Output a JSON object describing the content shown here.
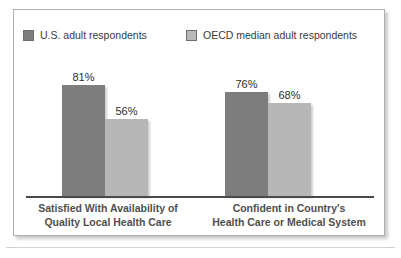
{
  "chart_data": {
    "type": "bar",
    "title": "",
    "subtitle": "",
    "xlabel": "",
    "ylabel": "",
    "ylim": [
      0,
      100
    ],
    "grid": false,
    "legend_position": "top",
    "categories": [
      "Satisfied With Availability of Quality Local Health Care",
      "Confident in Country's Health Care or Medical System"
    ],
    "category_lines": [
      [
        "Satisfied With Availability of",
        "Quality Local Health Care"
      ],
      [
        "Confident in Country's",
        "Health Care or Medical System"
      ]
    ],
    "series": [
      {
        "name": "U.S. adult respondents",
        "color": "#7d7d7d",
        "values": [
          81,
          76
        ],
        "value_labels": [
          "81%",
          "76%"
        ]
      },
      {
        "name": "OECD median adult respondents",
        "color": "#b7b7b7",
        "values": [
          56,
          68
        ],
        "value_labels": [
          "56%",
          "68%"
        ]
      }
    ],
    "points": [
      {
        "category_index": 0,
        "series": "U.S. adult respondents",
        "value": 81,
        "label": "81%"
      },
      {
        "category_index": 0,
        "series": "OECD median adult respondents",
        "value": 76,
        "label": "76%"
      },
      {
        "category_index": 1,
        "series": "U.S. adult respondents",
        "value": 56,
        "label": "56%"
      },
      {
        "category_index": 1,
        "series": "OECD median adult respondents",
        "value": 68,
        "label": "68%"
      }
    ]
  },
  "legend": {
    "items": [
      {
        "label": "U.S. adult respondents",
        "swatch_color": "#7d7d7d"
      },
      {
        "label": "OECD median adult respondents",
        "swatch_color": "#b7b7b7"
      }
    ]
  },
  "colors": {
    "series_dark": "#7d7d7d",
    "series_light": "#b7b7b7",
    "frame_border": "#b0b0b0",
    "baseline": "#4a4a4a",
    "label_text": "#4f4f4f",
    "value_text": "#2e2e2e",
    "background": "#ffffff"
  }
}
